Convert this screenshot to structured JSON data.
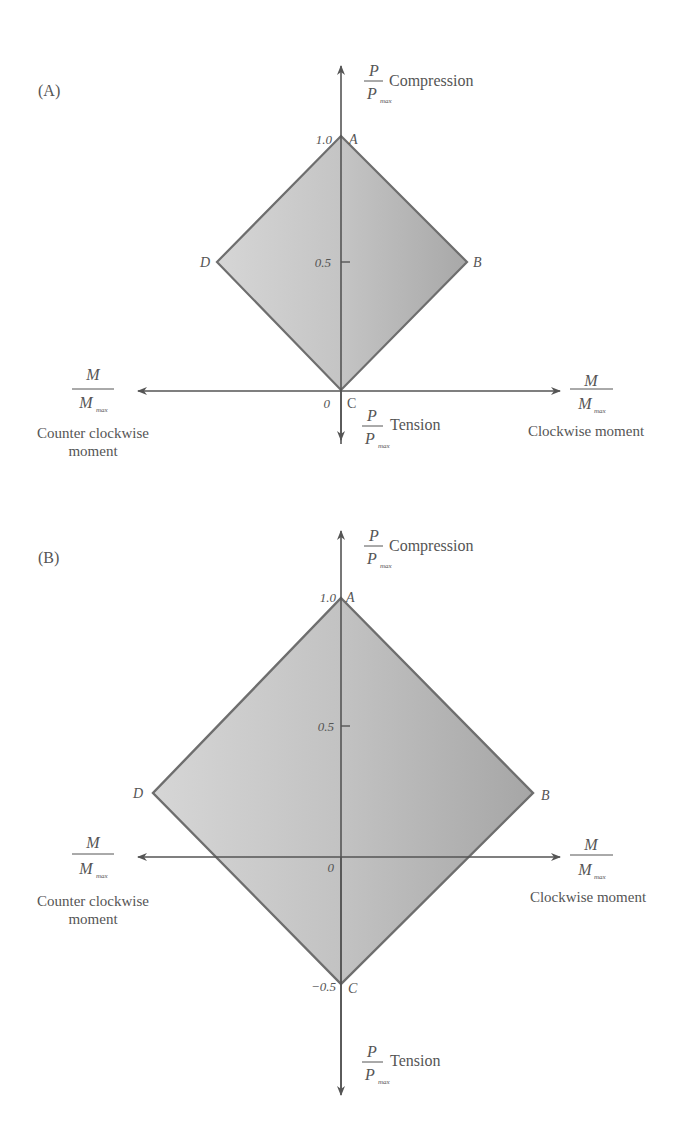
{
  "panels": [
    {
      "id": "A",
      "label": "(A)",
      "vertical_axis": {
        "top_fraction_num": "P",
        "top_fraction_den": "P",
        "top_fraction_sub": "max",
        "top_label": "Compression",
        "bottom_fraction_num": "P",
        "bottom_fraction_den": "P",
        "bottom_fraction_sub": "max",
        "bottom_label": "Tension"
      },
      "horizontal_axis": {
        "left_fraction_num": "M",
        "left_fraction_den": "M",
        "left_fraction_sub": "max",
        "left_label_line1": "Counter clockwise",
        "left_label_line2": "moment",
        "right_fraction_num": "M",
        "right_fraction_den": "M",
        "right_fraction_sub": "max",
        "right_label": "Clockwise moment"
      },
      "ticks": {
        "t1": "1.0",
        "t05": "0.5",
        "origin": "0"
      },
      "vertices": {
        "A": "A",
        "B": "B",
        "C": "C",
        "D": "D"
      }
    },
    {
      "id": "B",
      "label": "(B)",
      "vertical_axis": {
        "top_fraction_num": "P",
        "top_fraction_den": "P",
        "top_fraction_sub": "max",
        "top_label": "Compression",
        "bottom_fraction_num": "P",
        "bottom_fraction_den": "P",
        "bottom_fraction_sub": "max",
        "bottom_label": "Tension"
      },
      "horizontal_axis": {
        "left_fraction_num": "M",
        "left_fraction_den": "M",
        "left_fraction_sub": "max",
        "left_label_line1": "Counter clockwise",
        "left_label_line2": "moment",
        "right_fraction_num": "M",
        "right_fraction_den": "M",
        "right_fraction_sub": "max",
        "right_label": "Clockwise moment"
      },
      "ticks": {
        "t1": "1.0",
        "t05": "0.5",
        "origin": "0",
        "tneg05": "−0.5"
      },
      "vertices": {
        "A": "A",
        "B": "B",
        "C": "C",
        "D": "D"
      }
    }
  ],
  "colors": {
    "fill_light": "#d2d2d2",
    "fill_dark": "#a9a9a9",
    "outline": "#6e6e6e",
    "axis": "#555555"
  }
}
